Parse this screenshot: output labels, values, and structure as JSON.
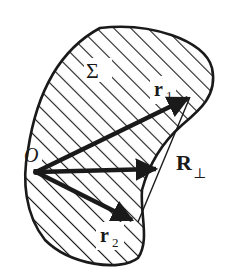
{
  "figure": {
    "region_label": "Σ",
    "origin_label": "O",
    "vectors": [
      {
        "name": "r1",
        "label_main": "r",
        "label_sub": "1"
      },
      {
        "name": "r2",
        "label_main": "r",
        "label_sub": "2"
      },
      {
        "name": "R_perp",
        "label_main": "R",
        "label_sub": "⊥"
      }
    ],
    "colors": {
      "ink": "#1a1a1a",
      "background": "#ffffff"
    }
  }
}
